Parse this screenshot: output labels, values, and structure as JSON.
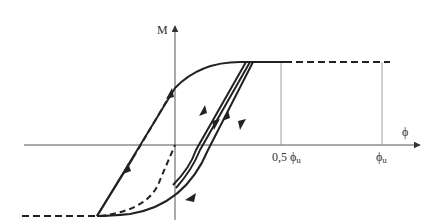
{
  "diagram": {
    "type": "moment-curvature hysteresis",
    "axes": {
      "vertical_label": "M",
      "horizontal_label": "ϕ"
    },
    "ticks": [
      {
        "label_main": "0,5 ϕ",
        "label_sub": "u"
      },
      {
        "label_main": "ϕ",
        "label_sub": "u"
      }
    ],
    "colors": {
      "line": "#222222",
      "axis": "#555555",
      "guide": "#777777"
    }
  }
}
